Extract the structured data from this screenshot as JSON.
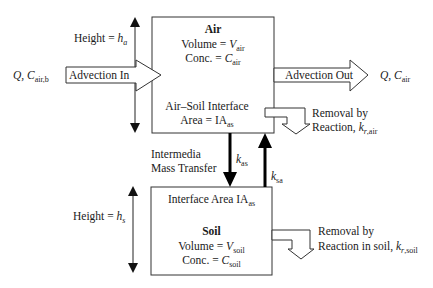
{
  "air": {
    "title": "Air",
    "volume_label": "Volume = ",
    "volume_var": "V",
    "volume_sub": "air",
    "conc_label": "Conc. = ",
    "conc_var": "C",
    "conc_sub": "air",
    "interface_line1": "Air–Soil Interface",
    "interface_label": "Area = IA",
    "interface_sub": "as"
  },
  "soil": {
    "interface_label": "Interface Area IA",
    "interface_sub": "as",
    "title": "Soil",
    "volume_label": "Volume = ",
    "volume_var": "V",
    "volume_sub": "soil",
    "conc_label": "Conc. = ",
    "conc_var": "C",
    "conc_sub": "soil"
  },
  "heights": {
    "air_label": "Height = ",
    "air_var": "h",
    "air_sub": "a",
    "soil_label": "Height = ",
    "soil_var": "h",
    "soil_sub": "s"
  },
  "advection_in": {
    "label": "Advection In",
    "source_var": "Q, C",
    "source_sub": "air,b"
  },
  "advection_out": {
    "label": "Advection Out",
    "dest_var": "Q, C",
    "dest_sub": "air"
  },
  "removal_air": {
    "line1": "Removal by",
    "line2": "Reaction, ",
    "var": "k",
    "sub_italic": "r",
    "sub": ",air"
  },
  "removal_soil": {
    "line1": "Removal by",
    "line2": "Reaction in soil, ",
    "var": "k",
    "sub_italic": "r",
    "sub": ",soil"
  },
  "intermedia": {
    "line1": "Intermedia",
    "line2": "Mass Transfer",
    "down_var": "k",
    "down_sub": "as",
    "up_var": "k",
    "up_sub": "sa"
  }
}
